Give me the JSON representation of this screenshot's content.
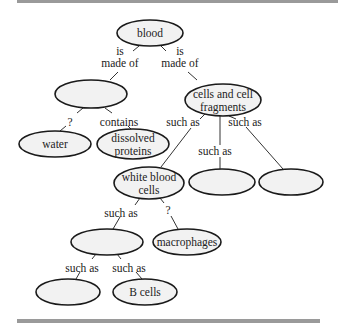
{
  "nodes": [
    {
      "id": "blood",
      "lines": [
        "blood"
      ]
    },
    {
      "id": "plasma-blank",
      "lines": []
    },
    {
      "id": "cells-fragments",
      "lines": [
        "cells and cell",
        "fragments"
      ]
    },
    {
      "id": "water",
      "lines": [
        "water"
      ]
    },
    {
      "id": "dissolved-proteins",
      "lines": [
        "dissolved",
        "proteins"
      ]
    },
    {
      "id": "white-blood-cells",
      "lines": [
        "white blood",
        "cells"
      ]
    },
    {
      "id": "blank-2",
      "lines": []
    },
    {
      "id": "blank-3",
      "lines": []
    },
    {
      "id": "blank-4",
      "lines": []
    },
    {
      "id": "macrophages",
      "lines": [
        "macrophages"
      ]
    },
    {
      "id": "blank-5",
      "lines": []
    },
    {
      "id": "b-cells",
      "lines": [
        "B cells"
      ]
    }
  ],
  "links": [
    {
      "from": "blood",
      "to": "plasma-blank",
      "lines": [
        "is",
        "made of"
      ]
    },
    {
      "from": "blood",
      "to": "cells-fragments",
      "lines": [
        "is",
        "made of"
      ]
    },
    {
      "from": "plasma-blank",
      "to": "water",
      "lines": [
        "?"
      ]
    },
    {
      "from": "plasma-blank",
      "to": "dissolved-proteins",
      "lines": [
        "contains"
      ]
    },
    {
      "from": "cells-fragments",
      "to": "white-blood-cells",
      "lines": [
        "such as"
      ]
    },
    {
      "from": "cells-fragments",
      "to": "blank-2",
      "lines": [
        "such as"
      ]
    },
    {
      "from": "cells-fragments",
      "to": "blank-3",
      "lines": [
        "such as"
      ]
    },
    {
      "from": "white-blood-cells",
      "to": "blank-4",
      "lines": [
        "such as"
      ]
    },
    {
      "from": "white-blood-cells",
      "to": "macrophages",
      "lines": [
        "?"
      ]
    },
    {
      "from": "blank-4",
      "to": "blank-5",
      "lines": [
        "such as"
      ]
    },
    {
      "from": "blank-4",
      "to": "b-cells",
      "lines": [
        "such as"
      ]
    }
  ],
  "colors": {
    "node_fill": "#f2f2f2",
    "stroke": "#1a1a1a",
    "rule": "#9a9a9a"
  }
}
